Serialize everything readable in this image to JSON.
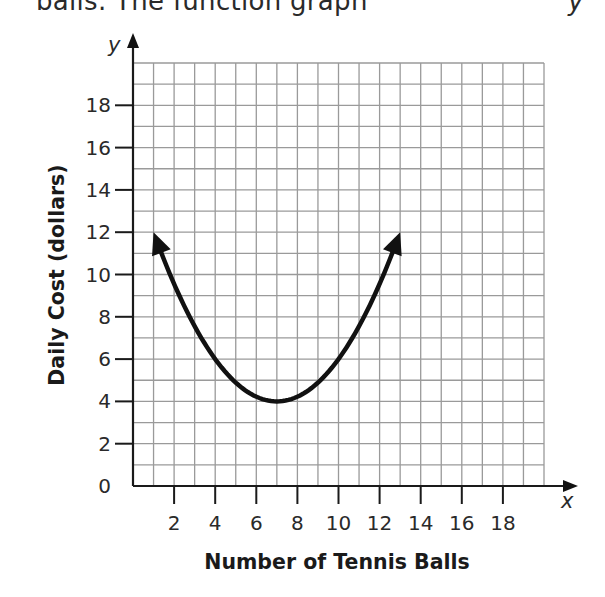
{
  "header_fragment": {
    "text": "balls. The function graph",
    "right_glyph": "y"
  },
  "chart_data": {
    "type": "line",
    "title": "",
    "xlabel": "Number of Tennis Balls",
    "ylabel": "Daily Cost (dollars)",
    "x_axis_var": "x",
    "y_axis_var": "y",
    "xlim": [
      0,
      20
    ],
    "ylim": [
      0,
      20
    ],
    "grid": true,
    "grid_step": 1,
    "x_ticks": [
      2,
      4,
      6,
      8,
      10,
      12,
      14,
      16,
      18
    ],
    "x_tick_labels": [
      "2",
      "4",
      "6",
      "8",
      "10",
      "12",
      "14",
      "16",
      "18"
    ],
    "y_ticks": [
      0,
      2,
      4,
      6,
      8,
      10,
      12,
      14,
      16,
      18
    ],
    "y_tick_labels": [
      "0",
      "2",
      "4",
      "6",
      "8",
      "10",
      "12",
      "14",
      "16",
      "18"
    ],
    "legend": null,
    "series": [
      {
        "name": "Daily cost function (parabola)",
        "shape": "parabola opening upward, arrows on both ends",
        "vertex": [
          7,
          4
        ],
        "endpoints": [
          [
            1,
            12
          ],
          [
            13,
            12
          ]
        ],
        "equation": "y = (2/9)(x - 7)^2 + 4",
        "x": [
          1,
          2,
          3,
          4,
          5,
          6,
          7,
          8,
          9,
          10,
          11,
          12,
          13
        ],
        "values": [
          12,
          9.56,
          7.56,
          6,
          4.89,
          4.22,
          4,
          4.22,
          4.89,
          6,
          7.56,
          9.56,
          12
        ]
      }
    ],
    "colors": {
      "curve": "#111111",
      "axis": "#1a1a1a",
      "grid": "#9a9a9a",
      "background": "#ffffff"
    }
  }
}
